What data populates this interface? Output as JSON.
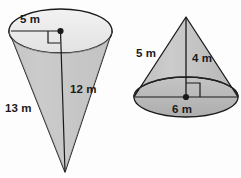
{
  "figure": {
    "background_color": "#fdfdfd",
    "shape_fill": "#c6c6c6",
    "shape_fill_light": "#e8e8e8",
    "shape_fill_dark": "#b4b4b4",
    "outline_color": "#1a1a1a"
  },
  "cones": [
    {
      "id": "left-cone",
      "orientation": "inverted",
      "description": "Inverted cone with apex pointing down, open elliptical top",
      "labels": {
        "radius": "5 m",
        "height": "12 m",
        "slant": "13 m"
      }
    },
    {
      "id": "right-cone",
      "orientation": "upright",
      "description": "Upright cone with apex pointing up, elliptical base",
      "labels": {
        "slant": "5 m",
        "height": "4 m",
        "diameter": "6 m"
      }
    }
  ]
}
